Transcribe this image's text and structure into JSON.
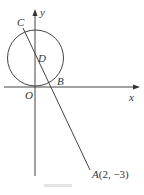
{
  "figure": {
    "axes": {
      "x_label": "x",
      "y_label": "y",
      "origin_label": "O"
    },
    "points": {
      "C": "C",
      "D": "D",
      "B": "B",
      "A": "A",
      "A_coords": "(2, −3)"
    },
    "circle": {
      "center_label": "D",
      "tangent_to": "x-axis at O"
    },
    "line": "Line through A(2, −3), B, D, C",
    "colors": {
      "stroke": "#333333",
      "background": "#ffffff"
    }
  }
}
